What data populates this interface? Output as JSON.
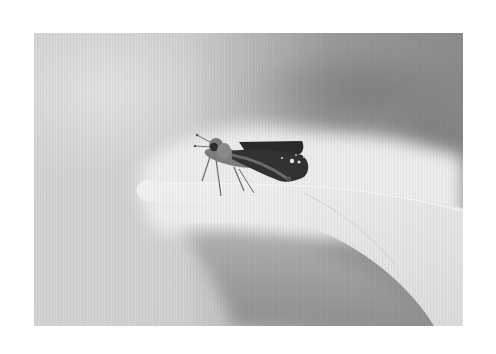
{
  "image": {
    "description": "Black and white macro photograph of a small skipper butterfly perched on the curled tip of a pale leaf against a soft blurred grey background, framed by a white border",
    "subject": "skipper butterfly",
    "setting": "leaf tip, blurred background",
    "color_mode": "grayscale",
    "border_color": "#ffffff",
    "palette": {
      "background_light": "#d6d6d6",
      "background_dark": "#8a8a8a",
      "leaf": "#ececec",
      "wing_dark": "#2a2a2a",
      "body": "#7a7a7a"
    }
  }
}
